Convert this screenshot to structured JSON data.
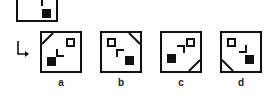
{
  "puzzle": {
    "type": "visual-analogy-multiple-choice",
    "arrow_icon": "down-right-arrow-icon",
    "sample": {
      "name": "sample-figure",
      "corner_mark": "┐",
      "filled_square": "black-square",
      "outlined_square": null
    },
    "options": [
      {
        "key": "a",
        "label": "a",
        "diagonal_corner": "top-left",
        "outlined_square_corner": "top-right",
        "filled_square_corner": "bottom-left",
        "center_mark": "L"
      },
      {
        "key": "b",
        "label": "b",
        "diagonal_corner": "top-right",
        "outlined_square_corner": "top-left",
        "filled_square_corner": "bottom-right",
        "center_mark": "┌"
      },
      {
        "key": "c",
        "label": "c",
        "diagonal_corner": "bottom-right",
        "outlined_square_corner": "top-right",
        "filled_square_corner": "middle-left",
        "center_mark": "┐"
      },
      {
        "key": "d",
        "label": "d",
        "diagonal_corner": "bottom-left",
        "outlined_square_corner": "top-left",
        "filled_square_corner": "bottom-right",
        "center_mark": "┘"
      }
    ],
    "colors": {
      "stroke": "#111111",
      "fill": "#111111",
      "background": "#ffffff"
    }
  }
}
